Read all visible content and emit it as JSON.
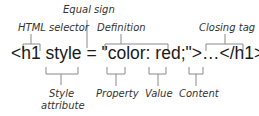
{
  "diagram": {
    "code_line": "<h1 style = \"color: red;\">…</h1>",
    "annotations_top": {
      "html_selector": "HTML selector",
      "equal_sign": "Equal sign",
      "definition": "Definition",
      "closing_tag": "Closing tag"
    },
    "annotations_bottom": {
      "style_attribute_line1": "Style",
      "style_attribute_line2": "attribute",
      "property": "Property",
      "value": "Value",
      "content": "Content"
    }
  }
}
